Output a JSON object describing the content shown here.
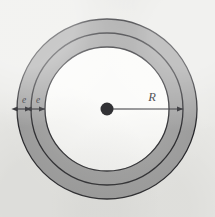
{
  "figure": {
    "canvas": {
      "width": 215,
      "height": 217
    },
    "background_color": "#e9e9e6",
    "center": {
      "x": 107,
      "y": 109
    },
    "dot": {
      "radius": 6.5,
      "color": "#101014"
    },
    "stroke_color": "#1a1a1e",
    "fill_gray": "#9a9a9a",
    "fill_white": "#fbfbf9",
    "circles": [
      {
        "name": "outer-circle",
        "radius": 90,
        "label": ""
      },
      {
        "name": "middle-circle",
        "radius": 76,
        "label": ""
      },
      {
        "name": "inner-circle",
        "radius": 62,
        "label": ""
      }
    ],
    "labels": {
      "band_outer": "e",
      "band_inner": "e",
      "radius": "R"
    },
    "dimension_lines": [
      {
        "name": "e-outer",
        "label": "e",
        "from_radius": 90,
        "to_radius": 76,
        "side": "left"
      },
      {
        "name": "e-inner",
        "label": "e",
        "from_radius": 76,
        "to_radius": 62,
        "side": "left"
      },
      {
        "name": "R",
        "label": "R",
        "from_radius": 0,
        "to_radius": 76,
        "side": "right"
      }
    ]
  }
}
